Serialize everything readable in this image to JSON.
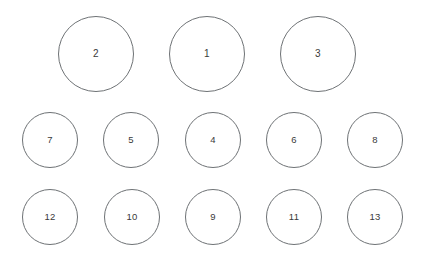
{
  "canvas": {
    "width": 424,
    "height": 259,
    "background": "#ffffff",
    "stroke_color": "#6e7275",
    "label_color": "#3a3a3a",
    "stroke_width": 1
  },
  "rows": [
    {
      "name": "top-row",
      "circle_diameter": 76,
      "y": 16,
      "circles": [
        {
          "label": "2",
          "x": 58,
          "y": 16,
          "d": 76
        },
        {
          "label": "1",
          "x": 169,
          "y": 16,
          "d": 76
        },
        {
          "label": "3",
          "x": 280,
          "y": 16,
          "d": 76
        }
      ]
    },
    {
      "name": "middle-row",
      "circle_diameter": 56,
      "y": 112,
      "circles": [
        {
          "label": "7",
          "x": 22,
          "y": 112,
          "d": 56
        },
        {
          "label": "5",
          "x": 103,
          "y": 112,
          "d": 56
        },
        {
          "label": "4",
          "x": 185,
          "y": 112,
          "d": 56
        },
        {
          "label": "6",
          "x": 266,
          "y": 112,
          "d": 56
        },
        {
          "label": "8",
          "x": 347,
          "y": 112,
          "d": 56
        }
      ]
    },
    {
      "name": "bottom-row",
      "circle_diameter": 56,
      "y": 189,
      "circles": [
        {
          "label": "12",
          "x": 22,
          "y": 189,
          "d": 56
        },
        {
          "label": "10",
          "x": 104,
          "y": 189,
          "d": 56
        },
        {
          "label": "9",
          "x": 185,
          "y": 189,
          "d": 56
        },
        {
          "label": "11",
          "x": 266,
          "y": 189,
          "d": 56
        },
        {
          "label": "13",
          "x": 347,
          "y": 189,
          "d": 56
        }
      ]
    }
  ]
}
